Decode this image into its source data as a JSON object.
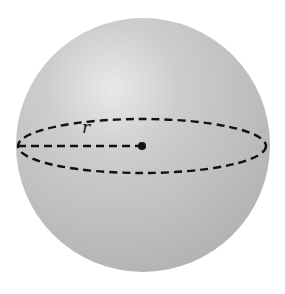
{
  "figure": {
    "sphere": {
      "cx": 143,
      "cy": 145,
      "r": 127,
      "fill": "#bdbdbd",
      "highlight": "#e6e6e6"
    },
    "equator": {
      "cx": 142,
      "cy": 146,
      "rx": 124,
      "ry": 27,
      "stroke": "#111111",
      "dash": "8 5"
    },
    "radius_line": {
      "x1": 18,
      "y1": 146,
      "x2": 142,
      "y2": 146
    },
    "center_point": {
      "cx": 142,
      "cy": 146,
      "r": 4
    },
    "labels": {
      "radius": "r"
    }
  }
}
